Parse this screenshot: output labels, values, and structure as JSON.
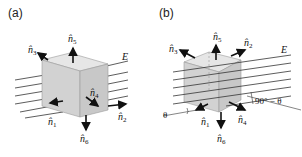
{
  "panels": [
    {
      "label": "(a)",
      "field_label": "E",
      "normals": [
        "n1",
        "n2",
        "n3",
        "n4",
        "n5",
        "n6"
      ],
      "normal_labels": {
        "n1": {
          "base": "n",
          "sub": "1"
        },
        "n2": {
          "base": "n",
          "sub": "2"
        },
        "n3": {
          "base": "n",
          "sub": "3"
        },
        "n4": {
          "base": "n",
          "sub": "4"
        },
        "n5": {
          "base": "n",
          "sub": "5"
        },
        "n6": {
          "base": "n",
          "sub": "6"
        }
      }
    },
    {
      "label": "(b)",
      "field_label": "E",
      "angle_label": "θ",
      "complement_angle_label": "90° − θ",
      "normal_labels": {
        "n1": {
          "base": "n",
          "sub": "1"
        },
        "n2": {
          "base": "n",
          "sub": "2"
        },
        "n3": {
          "base": "n",
          "sub": "3"
        },
        "n4": {
          "base": "n",
          "sub": "4"
        },
        "n5": {
          "base": "n",
          "sub": "5"
        },
        "n6": {
          "base": "n",
          "sub": "6"
        }
      }
    }
  ],
  "colors": {
    "cube_fill": "#d9d9d9",
    "cube_edge": "#9a9a9a",
    "field_line": "#333333",
    "arrow": "#111111"
  }
}
